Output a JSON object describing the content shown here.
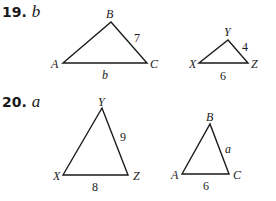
{
  "problems": [
    {
      "number": "19.",
      "unknown": "b",
      "triangles": [
        {
          "vertices": {
            "A": "A",
            "B": "B",
            "C": "C"
          },
          "sides": {
            "BC": "7",
            "AC": "b"
          }
        },
        {
          "vertices": {
            "X": "X",
            "Y": "Y",
            "Z": "Z"
          },
          "sides": {
            "YZ": "4",
            "XZ": "6"
          }
        }
      ]
    },
    {
      "number": "20.",
      "unknown": "a",
      "triangles": [
        {
          "vertices": {
            "X": "X",
            "Y": "Y",
            "Z": "Z"
          },
          "sides": {
            "YZ": "9",
            "XZ": "8"
          }
        },
        {
          "vertices": {
            "A": "A",
            "B": "B",
            "C": "C"
          },
          "sides": {
            "BC": "a",
            "AC": "6"
          }
        }
      ]
    }
  ],
  "colors": {
    "ink": "#1a1a1a",
    "background": "#ffffff"
  }
}
